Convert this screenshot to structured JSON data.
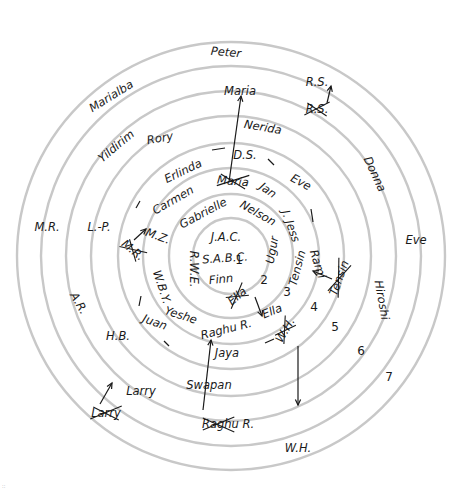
{
  "diagram": {
    "type": "concentric-relationship-circles",
    "center": {
      "x": 231,
      "y": 256
    },
    "ring_radii": [
      38,
      62,
      88,
      113,
      140,
      165,
      190,
      214
    ],
    "ring_numbers": [
      {
        "label": "1",
        "x": 239,
        "y": 264
      },
      {
        "label": "2",
        "x": 264,
        "y": 284
      },
      {
        "label": "3",
        "x": 287,
        "y": 296
      },
      {
        "label": "4",
        "x": 314,
        "y": 311
      },
      {
        "label": "5",
        "x": 335,
        "y": 331
      },
      {
        "label": "6",
        "x": 361,
        "y": 355
      },
      {
        "label": "7",
        "x": 389,
        "y": 381
      }
    ],
    "names": [
      {
        "id": "jac",
        "text": "J.A.C.",
        "x": 226,
        "y": 237,
        "rot": 0
      },
      {
        "id": "sabc",
        "text": "S.A.B.C.",
        "x": 225,
        "y": 258,
        "rot": -4
      },
      {
        "id": "finn",
        "text": "Finn",
        "x": 221,
        "y": 279,
        "rot": -6
      },
      {
        "id": "gabrielle",
        "text": "Gabrielle",
        "x": 203,
        "y": 213,
        "rot": -28
      },
      {
        "id": "nelson",
        "text": "Nelson",
        "x": 258,
        "y": 213,
        "rot": 30
      },
      {
        "id": "ugur",
        "text": "Ugur",
        "x": 272,
        "y": 250,
        "rot": -80
      },
      {
        "id": "rwe",
        "text": "R.W.E.",
        "x": 194,
        "y": 269,
        "rot": 90
      },
      {
        "id": "ella-crossed",
        "text": "Ella",
        "x": 237,
        "y": 296,
        "rot": -40,
        "crossed": true
      },
      {
        "id": "carmen",
        "text": "Carmen",
        "x": 173,
        "y": 200,
        "rot": -30
      },
      {
        "id": "maria-crossed",
        "text": "Maria",
        "x": 233,
        "y": 181,
        "rot": 5,
        "crossed": true
      },
      {
        "id": "jan",
        "text": "Jan",
        "x": 268,
        "y": 190,
        "rot": 35
      },
      {
        "id": "jess",
        "text": "J. Jess",
        "x": 291,
        "y": 226,
        "rot": 70
      },
      {
        "id": "tensin-inner",
        "text": "Tensin",
        "x": 297,
        "y": 268,
        "rot": -75
      },
      {
        "id": "raghu-r",
        "text": "Raghu R.",
        "x": 226,
        "y": 329,
        "rot": -14
      },
      {
        "id": "ella",
        "text": "Ella",
        "x": 272,
        "y": 311,
        "rot": -22
      },
      {
        "id": "yeshe",
        "text": "Yeshe",
        "x": 181,
        "y": 315,
        "rot": 18
      },
      {
        "id": "wby",
        "text": "W.B.Y.",
        "x": 162,
        "y": 287,
        "rot": 72
      },
      {
        "id": "mz",
        "text": "M.Z.",
        "x": 158,
        "y": 236,
        "rot": 20
      },
      {
        "id": "erlinda",
        "text": "Erlinda",
        "x": 183,
        "y": 171,
        "rot": -26
      },
      {
        "id": "ds",
        "text": "D.S.",
        "x": 245,
        "y": 155,
        "rot": 0
      },
      {
        "id": "eve-inner",
        "text": "Eve",
        "x": 301,
        "y": 182,
        "rot": 28
      },
      {
        "id": "rami",
        "text": "Rami",
        "x": 318,
        "y": 264,
        "rot": 72
      },
      {
        "id": "mr-crossed",
        "text": "M.R.",
        "x": 133,
        "y": 250,
        "rot": 40,
        "crossed": true
      },
      {
        "id": "juan",
        "text": "Juan",
        "x": 155,
        "y": 322,
        "rot": 20
      },
      {
        "id": "jaya",
        "text": "Jaya",
        "x": 227,
        "y": 353,
        "rot": 0
      },
      {
        "id": "wh-crossed",
        "text": "W.H.",
        "x": 285,
        "y": 330,
        "rot": -60,
        "crossed": true
      },
      {
        "id": "rory",
        "text": "Rory",
        "x": 160,
        "y": 138,
        "rot": -10
      },
      {
        "id": "nerida",
        "text": "Nerida",
        "x": 263,
        "y": 127,
        "rot": 10
      },
      {
        "id": "tensin-crossed",
        "text": "Tensin",
        "x": 339,
        "y": 278,
        "rot": -70,
        "crossed": true
      },
      {
        "id": "lp",
        "text": "L.-P.",
        "x": 99,
        "y": 227,
        "rot": 0
      },
      {
        "id": "hb",
        "text": "H.B.",
        "x": 118,
        "y": 336,
        "rot": 0
      },
      {
        "id": "swapan",
        "text": "Swapan",
        "x": 209,
        "y": 385,
        "rot": 0
      },
      {
        "id": "yildirim",
        "text": "Yildirim",
        "x": 116,
        "y": 146,
        "rot": -40
      },
      {
        "id": "maria-outer",
        "text": "Maria",
        "x": 240,
        "y": 91,
        "rot": 0
      },
      {
        "id": "rs-crossed",
        "text": "R.S.",
        "x": 317,
        "y": 109,
        "rot": 0,
        "crossed": true
      },
      {
        "id": "donna",
        "text": "Donna",
        "x": 375,
        "y": 174,
        "rot": 65
      },
      {
        "id": "hiroshi",
        "text": "Hiroshi",
        "x": 382,
        "y": 300,
        "rot": 80
      },
      {
        "id": "larry-crossed",
        "text": "Larry",
        "x": 106,
        "y": 413,
        "rot": 0,
        "crossed": true
      },
      {
        "id": "raghu-crossed",
        "text": "Raghu R.",
        "x": 228,
        "y": 424,
        "rot": 0,
        "crossed_part": "Raghu"
      },
      {
        "id": "ar",
        "text": "A.R.",
        "x": 79,
        "y": 303,
        "rot": 60
      },
      {
        "id": "larry",
        "text": "Larry",
        "x": 141,
        "y": 391,
        "rot": 0
      },
      {
        "id": "mr",
        "text": "M.R.",
        "x": 47,
        "y": 227,
        "rot": 0
      },
      {
        "id": "marialba",
        "text": "Marialba",
        "x": 111,
        "y": 96,
        "rot": -32
      },
      {
        "id": "peter",
        "text": "Peter",
        "x": 226,
        "y": 52,
        "rot": 5
      },
      {
        "id": "rs",
        "text": "R.S.",
        "x": 317,
        "y": 82,
        "rot": 0
      },
      {
        "id": "eve-outer",
        "text": "Eve",
        "x": 416,
        "y": 240,
        "rot": 0
      },
      {
        "id": "wh",
        "text": "W.H.",
        "x": 298,
        "y": 448,
        "rot": 0
      }
    ],
    "arrows": [
      {
        "id": "maria-to-outer",
        "from": [
          229,
          182
        ],
        "to": [
          241,
          96
        ]
      },
      {
        "id": "rs-up",
        "from": [
          327,
          103
        ],
        "to": [
          331,
          86
        ]
      },
      {
        "id": "ella-out",
        "from": [
          255,
          297
        ],
        "to": [
          262,
          316
        ]
      },
      {
        "id": "mr-to-mz",
        "from": [
          134,
          240
        ],
        "to": [
          146,
          229
        ]
      },
      {
        "id": "tensin-to-rami",
        "from": [
          332,
          279
        ],
        "to": [
          313,
          271
        ]
      },
      {
        "id": "wh-down",
        "from": [
          298,
          346
        ],
        "to": [
          298,
          405
        ]
      },
      {
        "id": "larry-up",
        "from": [
          100,
          404
        ],
        "to": [
          112,
          383
        ]
      },
      {
        "id": "raghu-up",
        "from": [
          203,
          410
        ],
        "to": [
          211,
          340
        ]
      }
    ],
    "dashes": [
      {
        "x1": 136,
        "y1": 208,
        "x2": 140,
        "y2": 201
      },
      {
        "x1": 212,
        "y1": 150,
        "x2": 225,
        "y2": 148
      },
      {
        "x1": 268,
        "y1": 159,
        "x2": 274,
        "y2": 165
      },
      {
        "x1": 311,
        "y1": 209,
        "x2": 313,
        "y2": 222
      },
      {
        "x1": 141,
        "y1": 296,
        "x2": 139,
        "y2": 306
      },
      {
        "x1": 164,
        "y1": 341,
        "x2": 169,
        "y2": 346
      },
      {
        "x1": 265,
        "y1": 343,
        "x2": 274,
        "y2": 339
      }
    ],
    "corner_mark": "::"
  }
}
